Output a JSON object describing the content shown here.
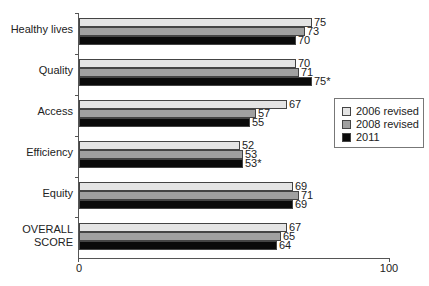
{
  "chart_data": {
    "type": "bar",
    "orientation": "horizontal",
    "title": "",
    "xlabel": "",
    "ylabel": "",
    "xlim": [
      0,
      100
    ],
    "x_ticks": [
      "0",
      "100"
    ],
    "grid": false,
    "legend_position": "right",
    "categories": [
      "Healthy lives",
      "Quality",
      "Access",
      "Efficiency",
      "Equity",
      "OVERALL SCORE"
    ],
    "series": [
      {
        "name": "2006 revised",
        "color": "#e4e4e4",
        "values": [
          75,
          70,
          67,
          52,
          69,
          67
        ],
        "labels": [
          "75",
          "70",
          "67",
          "52",
          "69",
          "67"
        ]
      },
      {
        "name": "2008 revised",
        "color": "#a0a0a0",
        "values": [
          73,
          71,
          57,
          53,
          71,
          65
        ],
        "labels": [
          "73",
          "71",
          "57",
          "53",
          "71",
          "65"
        ]
      },
      {
        "name": "2011",
        "color": "#0a0a0a",
        "values": [
          70,
          75,
          55,
          53,
          69,
          64
        ],
        "labels": [
          "70",
          "75*",
          "55",
          "53*",
          "69",
          "64"
        ]
      }
    ]
  },
  "axis": {
    "min_label": "0",
    "max_label": "100"
  },
  "legend": {
    "items": [
      {
        "label": "2006 revised",
        "color": "#e4e4e4"
      },
      {
        "label": "2008 revised",
        "color": "#a0a0a0"
      },
      {
        "label": "2011",
        "color": "#0a0a0a"
      }
    ]
  },
  "category_labels": {
    "c0": "Healthy lives",
    "c1": "Quality",
    "c2": "Access",
    "c3": "Efficiency",
    "c4": "Equity",
    "c5_line1": "OVERALL",
    "c5_line2": "SCORE"
  }
}
